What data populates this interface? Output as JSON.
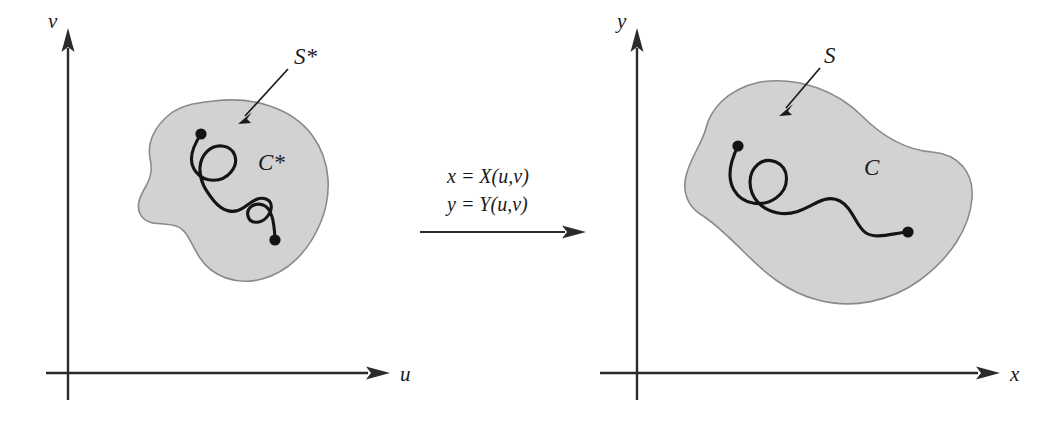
{
  "figure": {
    "type": "math-transformation-diagram",
    "background_color": "#ffffff",
    "region_fill_color": "#d2d2d2",
    "region_stroke_color": "#8a8a8a",
    "curve_color": "#141414",
    "axis_color": "#2b2b2b"
  },
  "left_panel": {
    "name": "uv-plane",
    "axes": {
      "vertical_label": "v",
      "horizontal_label": "u"
    },
    "region_label": "S*",
    "curve_label": "C*",
    "curve_endpoints": 2
  },
  "transform": {
    "equation_x": "x  =  X(u,v)",
    "equation_y": "y  =  Y(u,v)",
    "arrow_direction": "right"
  },
  "right_panel": {
    "name": "xy-plane",
    "axes": {
      "vertical_label": "y",
      "horizontal_label": "x"
    },
    "region_label": "S",
    "curve_label": "C",
    "curve_endpoints": 2
  }
}
